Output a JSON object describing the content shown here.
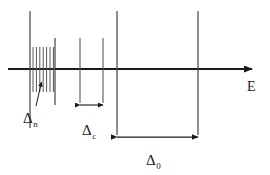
{
  "figure": {
    "type": "energy-level-spectrum-diagram",
    "axis": {
      "label": "E",
      "orientation": "horizontal",
      "arrow": "right",
      "y": 69,
      "x_start": 8,
      "x_end": 258
    },
    "colors": {
      "ink": "#1a1a1a",
      "line": "#4a4a4a",
      "background": "#ffffff"
    },
    "levels": [
      {
        "name": "level-band-left-edge",
        "x": 30,
        "top": 11,
        "bottom": 128,
        "weight": "medium"
      },
      {
        "name": "level-band-right-edge",
        "x": 55,
        "top": 38,
        "bottom": 105,
        "weight": "medium"
      },
      {
        "name": "level-c-left",
        "x": 80,
        "top": 38,
        "bottom": 103,
        "weight": "thin"
      },
      {
        "name": "level-c-right",
        "x": 103,
        "top": 38,
        "bottom": 103,
        "weight": "thin"
      },
      {
        "name": "level-zero-left",
        "x": 117,
        "top": 11,
        "bottom": 135,
        "weight": "medium"
      },
      {
        "name": "level-zero-right",
        "x": 198,
        "top": 11,
        "bottom": 135,
        "weight": "medium"
      }
    ],
    "fine_structure": {
      "name": "fine-level-cluster",
      "count": 7,
      "x_start": 33,
      "x_spacing": 3.4,
      "top": 47,
      "bottom": 92
    },
    "labels": [
      {
        "id": "delta-n",
        "symbol": "Δ",
        "subscript": "n",
        "description": "fine level spacing within cluster",
        "x": 23,
        "y": 110
      },
      {
        "id": "delta-c",
        "symbol": "Δ",
        "subscript": "c",
        "description": "intermediate level spacing",
        "x": 82,
        "y": 122
      },
      {
        "id": "delta-0",
        "symbol": "Δ",
        "subscript": "0",
        "description": "coarse level spacing",
        "x": 146,
        "y": 152
      },
      {
        "id": "axis-E",
        "symbol": "E",
        "subscript": "",
        "description": "energy axis label",
        "x": 247,
        "y": 80
      }
    ],
    "measures": [
      {
        "id": "delta-n-pointer",
        "kind": "pointer-arrow",
        "from_x": 36,
        "from_y": 106,
        "to_x": 41,
        "to_y": 82
      },
      {
        "id": "delta-c-span",
        "kind": "double-arrow",
        "x1": 80,
        "x2": 103,
        "y": 105
      },
      {
        "id": "delta-0-span",
        "kind": "double-arrow",
        "x1": 117,
        "x2": 198,
        "y": 137
      }
    ]
  }
}
